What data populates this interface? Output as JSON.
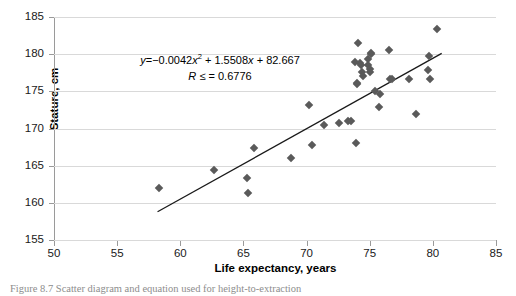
{
  "chart_data": {
    "type": "scatter",
    "title": "",
    "xlabel": "Life expectancy, years",
    "ylabel": "Stature, cm",
    "xlim": [
      50,
      85
    ],
    "ylim": [
      155,
      185
    ],
    "xticks": [
      50,
      55,
      60,
      65,
      70,
      75,
      80,
      85
    ],
    "yticks": [
      155,
      160,
      165,
      170,
      175,
      180,
      185
    ],
    "grid": "horizontal",
    "legend": "none",
    "marker_color": "#5a5a5a",
    "marker_shape": "diamond",
    "trendline": {
      "type": "linear-segment",
      "color": "#1a1a1a",
      "x_start": 58.2,
      "y_start": 158.8,
      "x_end": 80.7,
      "y_end": 180.1
    },
    "annotation": {
      "equation_prefix": "y",
      "equation_eq": "=",
      "equation_a": "−0.0042",
      "equation_x2_var": "x",
      "equation_x2_exp": "2",
      "equation_b": "+ 1.5508",
      "equation_x_var": "x",
      "equation_c": "+ 82.667",
      "r_symbol": "R",
      "r_relation": "≤ =",
      "r_value": "0.6776"
    },
    "points": [
      {
        "x": 58.3,
        "y": 162.0
      },
      {
        "x": 62.7,
        "y": 164.4
      },
      {
        "x": 65.3,
        "y": 163.4
      },
      {
        "x": 65.4,
        "y": 161.3
      },
      {
        "x": 65.8,
        "y": 167.4
      },
      {
        "x": 68.8,
        "y": 166.0
      },
      {
        "x": 70.2,
        "y": 173.1
      },
      {
        "x": 70.4,
        "y": 167.8
      },
      {
        "x": 71.4,
        "y": 170.5
      },
      {
        "x": 72.6,
        "y": 170.8
      },
      {
        "x": 73.3,
        "y": 171.0
      },
      {
        "x": 73.5,
        "y": 171.0
      },
      {
        "x": 73.9,
        "y": 168.0
      },
      {
        "x": 73.8,
        "y": 178.9
      },
      {
        "x": 74.0,
        "y": 176.1
      },
      {
        "x": 74.0,
        "y": 176.0
      },
      {
        "x": 74.1,
        "y": 181.5
      },
      {
        "x": 74.2,
        "y": 178.8
      },
      {
        "x": 74.3,
        "y": 178.5
      },
      {
        "x": 74.4,
        "y": 177.6
      },
      {
        "x": 74.5,
        "y": 177.0
      },
      {
        "x": 74.9,
        "y": 179.3
      },
      {
        "x": 74.9,
        "y": 178.6
      },
      {
        "x": 75.0,
        "y": 178.0
      },
      {
        "x": 75.0,
        "y": 177.6
      },
      {
        "x": 75.1,
        "y": 180.2
      },
      {
        "x": 75.1,
        "y": 180.0
      },
      {
        "x": 75.4,
        "y": 175.1
      },
      {
        "x": 75.7,
        "y": 172.9
      },
      {
        "x": 75.8,
        "y": 174.7
      },
      {
        "x": 76.5,
        "y": 180.5
      },
      {
        "x": 76.6,
        "y": 176.7
      },
      {
        "x": 76.8,
        "y": 176.7
      },
      {
        "x": 78.1,
        "y": 176.7
      },
      {
        "x": 78.7,
        "y": 171.9
      },
      {
        "x": 79.6,
        "y": 177.9
      },
      {
        "x": 79.7,
        "y": 179.8
      },
      {
        "x": 79.8,
        "y": 176.7
      },
      {
        "x": 80.3,
        "y": 183.4
      }
    ]
  },
  "caption": {
    "text": "Figure 8.7  Scatter diagram and equation used for height-to-extraction"
  }
}
